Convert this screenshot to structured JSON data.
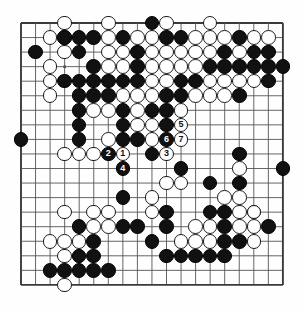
{
  "diagram": {
    "type": "go-board-diagram",
    "board_size": 19,
    "geometry": {
      "origin_x": 21,
      "origin_y": 23,
      "spacing": 14.55,
      "stone_radius": 7.3,
      "line_color": "#555555",
      "border_color": "#3a3a3a",
      "black_color": "#111111",
      "white_color": "#ffffff",
      "background": "#fefefe"
    },
    "star_points": [
      [
        4,
        4
      ],
      [
        10,
        4
      ],
      [
        16,
        4
      ],
      [
        4,
        10
      ],
      [
        10,
        10
      ],
      [
        16,
        10
      ],
      [
        4,
        16
      ],
      [
        10,
        16
      ],
      [
        16,
        16
      ]
    ],
    "black_stones": [
      [
        10,
        1
      ],
      [
        4,
        2
      ],
      [
        5,
        2
      ],
      [
        6,
        2
      ],
      [
        8,
        2
      ],
      [
        11,
        2
      ],
      [
        12,
        2
      ],
      [
        16,
        2
      ],
      [
        2,
        3
      ],
      [
        5,
        3
      ],
      [
        9,
        3
      ],
      [
        15,
        3
      ],
      [
        17,
        3
      ],
      [
        18,
        3
      ],
      [
        6,
        4
      ],
      [
        9,
        4
      ],
      [
        14,
        4
      ],
      [
        15,
        4
      ],
      [
        16,
        4
      ],
      [
        17,
        4
      ],
      [
        18,
        4
      ],
      [
        19,
        4
      ],
      [
        4,
        5
      ],
      [
        5,
        5
      ],
      [
        6,
        5
      ],
      [
        7,
        5
      ],
      [
        8,
        5
      ],
      [
        9,
        5
      ],
      [
        12,
        5
      ],
      [
        13,
        5
      ],
      [
        18,
        5
      ],
      [
        5,
        6
      ],
      [
        6,
        6
      ],
      [
        7,
        6
      ],
      [
        11,
        6
      ],
      [
        12,
        6
      ],
      [
        16,
        6
      ],
      [
        5,
        7
      ],
      [
        8,
        7
      ],
      [
        10,
        7
      ],
      [
        11,
        7
      ],
      [
        5,
        8
      ],
      [
        8,
        8
      ],
      [
        11,
        8
      ],
      [
        1,
        9
      ],
      [
        5,
        9
      ],
      [
        8,
        9
      ],
      [
        9,
        9
      ],
      [
        10,
        10
      ],
      [
        16,
        10
      ],
      [
        12,
        11
      ],
      [
        19,
        11
      ],
      [
        14,
        12
      ],
      [
        16,
        12
      ],
      [
        8,
        13
      ],
      [
        11,
        14
      ],
      [
        14,
        14
      ],
      [
        15,
        14
      ],
      [
        5,
        15
      ],
      [
        8,
        15
      ],
      [
        9,
        15
      ],
      [
        11,
        15
      ],
      [
        15,
        15
      ],
      [
        18,
        15
      ],
      [
        6,
        16
      ],
      [
        10,
        16
      ],
      [
        15,
        16
      ],
      [
        16,
        16
      ],
      [
        5,
        17
      ],
      [
        6,
        17
      ],
      [
        11,
        17
      ],
      [
        12,
        17
      ],
      [
        13,
        17
      ],
      [
        14,
        17
      ],
      [
        15,
        17
      ],
      [
        3,
        18
      ],
      [
        4,
        18
      ],
      [
        5,
        18
      ],
      [
        6,
        18
      ],
      [
        7,
        18
      ]
    ],
    "white_stones": [
      [
        4,
        1
      ],
      [
        7,
        1
      ],
      [
        11,
        1
      ],
      [
        14,
        1
      ],
      [
        4,
        2
      ],
      [
        3,
        2
      ],
      [
        7,
        2
      ],
      [
        9,
        2
      ],
      [
        10,
        2
      ],
      [
        13,
        2
      ],
      [
        14,
        2
      ],
      [
        15,
        2
      ],
      [
        17,
        2
      ],
      [
        18,
        2
      ],
      [
        4,
        3
      ],
      [
        7,
        3
      ],
      [
        8,
        3
      ],
      [
        10,
        3
      ],
      [
        11,
        3
      ],
      [
        12,
        3
      ],
      [
        13,
        3
      ],
      [
        14,
        3
      ],
      [
        16,
        3
      ],
      [
        3,
        4
      ],
      [
        7,
        4
      ],
      [
        8,
        4
      ],
      [
        10,
        4
      ],
      [
        11,
        4
      ],
      [
        12,
        4
      ],
      [
        13,
        4
      ],
      [
        3,
        5
      ],
      [
        10,
        5
      ],
      [
        11,
        5
      ],
      [
        14,
        5
      ],
      [
        15,
        5
      ],
      [
        16,
        5
      ],
      [
        17,
        5
      ],
      [
        3,
        6
      ],
      [
        8,
        6
      ],
      [
        9,
        6
      ],
      [
        10,
        6
      ],
      [
        13,
        6
      ],
      [
        14,
        6
      ],
      [
        15,
        6
      ],
      [
        6,
        7
      ],
      [
        7,
        7
      ],
      [
        9,
        7
      ],
      [
        12,
        7
      ],
      [
        9,
        8
      ],
      [
        10,
        8
      ],
      [
        7,
        9
      ],
      [
        10,
        9
      ],
      [
        4,
        10
      ],
      [
        5,
        10
      ],
      [
        6,
        10
      ],
      [
        11,
        12
      ],
      [
        12,
        12
      ],
      [
        10,
        13
      ],
      [
        15,
        13
      ],
      [
        16,
        13
      ],
      [
        4,
        14
      ],
      [
        17,
        14
      ],
      [
        6,
        14
      ],
      [
        7,
        14
      ],
      [
        10,
        14
      ],
      [
        16,
        14
      ],
      [
        17,
        14
      ],
      [
        16,
        11
      ],
      [
        6,
        15
      ],
      [
        7,
        15
      ],
      [
        13,
        15
      ],
      [
        14,
        15
      ],
      [
        17,
        15
      ],
      [
        12,
        16
      ],
      [
        13,
        16
      ],
      [
        14,
        16
      ],
      [
        17,
        16
      ],
      [
        3,
        16
      ],
      [
        4,
        16
      ],
      [
        5,
        16
      ],
      [
        16,
        15
      ],
      [
        4,
        17
      ],
      [
        5,
        17
      ],
      [
        4,
        19
      ]
    ],
    "numbered_moves": [
      {
        "label": "1",
        "color": "white",
        "col": 8,
        "row": 10
      },
      {
        "label": "2",
        "color": "black",
        "col": 7,
        "row": 10
      },
      {
        "label": "3",
        "color": "white",
        "col": 11,
        "row": 10
      },
      {
        "label": "4",
        "color": "black",
        "col": 8,
        "row": 11
      },
      {
        "label": "5",
        "color": "white",
        "col": 12,
        "row": 8
      },
      {
        "label": "6",
        "color": "black",
        "col": 11,
        "row": 9
      },
      {
        "label": "7",
        "color": "white",
        "col": 12,
        "row": 9
      }
    ]
  }
}
